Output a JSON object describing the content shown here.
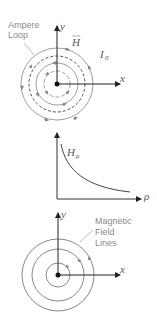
{
  "figures": {
    "top": {
      "title": "Ampere loop field diagram",
      "ampere_label_line1": "Ampere",
      "ampere_label_line2": "Loop",
      "field_label": "H",
      "current_label": "I",
      "current_sub": "0",
      "x_axis": "x",
      "y_axis": "y"
    },
    "middle": {
      "type": "line",
      "curve_label": "H",
      "curve_sub": "ρ",
      "x_axis": "ρ"
    },
    "bottom": {
      "label_line1": "Magnetic",
      "label_line2": "Field",
      "label_line3": "Lines",
      "x_axis": "x",
      "y_axis": "y"
    }
  },
  "colors": {
    "axis": "#222222",
    "circle": "#9a9a9a",
    "dashed": "#555555",
    "label": "#8a8a8a"
  }
}
